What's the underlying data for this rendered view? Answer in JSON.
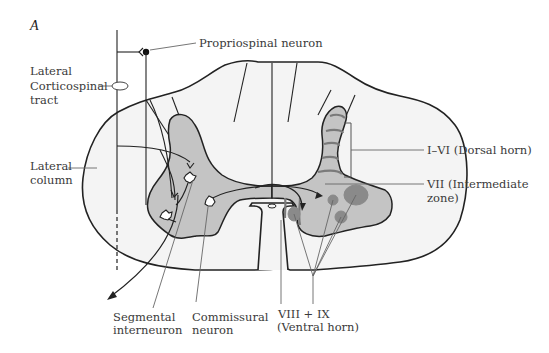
{
  "figure": {
    "panel_label": "A"
  },
  "labels": {
    "propriospinal": "Propriospinal neuron",
    "lateral_corticospinal_1": "Lateral",
    "lateral_corticospinal_2": "Corticospinal",
    "lateral_corticospinal_3": "tract",
    "lateral_column_1": "Lateral",
    "lateral_column_2": "column",
    "dorsal_horn": "I–VI (Dorsal horn)",
    "intermediate_1": "VII (Intermediate",
    "intermediate_2": "zone)",
    "segmental_1": "Segmental",
    "segmental_2": "interneuron",
    "commissural_1": "Commissural",
    "commissural_2": "neuron",
    "ventral_1": "VIII + IX",
    "ventral_2": "(Ventral horn)"
  },
  "colors": {
    "white_matter": "#f4f4f4",
    "grey_matter": "#c4c4c4",
    "laminae_lines": "#7a7a7a",
    "motor_nuclei": "#8a8a8a",
    "outline": "#222222"
  }
}
